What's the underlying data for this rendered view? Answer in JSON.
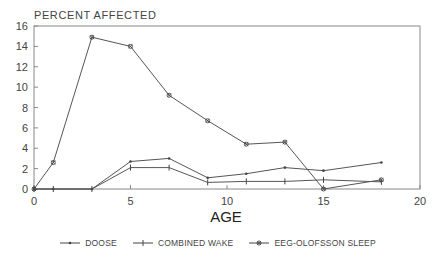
{
  "chart_data": {
    "type": "line",
    "title": "PERCENT AFFECTED",
    "xlabel": "AGE",
    "ylabel": "PERCENT AFFECTED",
    "xlim": [
      0,
      20
    ],
    "ylim": [
      0,
      16
    ],
    "xticks": [
      0,
      5,
      10,
      15,
      20
    ],
    "yticks": [
      0,
      2,
      4,
      6,
      8,
      10,
      12,
      14,
      16
    ],
    "grid": false,
    "legend_position": "bottom",
    "series": [
      {
        "name": "DOOSE",
        "marker": "dot",
        "x": [
          0,
          1,
          3,
          5,
          7,
          9,
          11,
          13,
          15,
          18
        ],
        "values": [
          0,
          0,
          0,
          2.7,
          3.0,
          1.1,
          1.5,
          2.1,
          1.8,
          2.6
        ]
      },
      {
        "name": "COMBINED WAKE",
        "marker": "plus",
        "x": [
          0,
          1,
          3,
          5,
          7,
          9,
          11,
          13,
          15,
          18
        ],
        "values": [
          0,
          0,
          0,
          2.1,
          2.1,
          0.65,
          0.75,
          0.75,
          0.9,
          0.7
        ]
      },
      {
        "name": "EEG-OLOFSSON SLEEP",
        "marker": "star",
        "x": [
          0,
          1,
          3,
          5,
          7,
          9,
          11,
          13,
          15,
          18
        ],
        "values": [
          0,
          2.6,
          14.9,
          14.0,
          9.2,
          6.7,
          4.4,
          4.6,
          0,
          0.9
        ]
      }
    ]
  },
  "legend": {
    "items": [
      {
        "label": "DOOSE"
      },
      {
        "label": "COMBINED WAKE"
      },
      {
        "label": "EEG-OLOFSSON SLEEP"
      }
    ]
  }
}
